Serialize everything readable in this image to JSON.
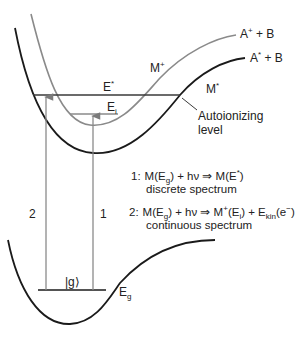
{
  "diagram": {
    "curves": {
      "ion_state": {
        "name": "M+",
        "asymptote": "A+ + B",
        "color": "#8a8a8a"
      },
      "excited_state": {
        "name": "M*",
        "asymptote": "A* + B",
        "color": "#1a1a1a"
      },
      "ground_state": {
        "name": "ground",
        "color": "#1a1a1a"
      }
    },
    "labels": {
      "ion_asymptote": {
        "main": "A",
        "sup": "+",
        "rest": " + B"
      },
      "excited_asymptote": {
        "main": "A",
        "sup": "*",
        "rest": " + B"
      },
      "ion_curve": {
        "main": "M",
        "sup": "+"
      },
      "excited_curve": {
        "main": "M",
        "sup": "*"
      },
      "e_star": {
        "main": "E",
        "sup": "*"
      },
      "e_i": {
        "main": "E",
        "sub": "i"
      },
      "autoionizing_line1": "Autoionizing",
      "autoionizing_line2": "level",
      "ground_ket": "|g⟩",
      "e_g": {
        "main": "E",
        "sub": "g"
      },
      "arrow_1": "1",
      "arrow_2": "2"
    },
    "equations": {
      "eq1": {
        "number": "1:",
        "lhs": "M(E",
        "lhs_sub": "g",
        "lhs_rest": ") + hν ⇒ M(E",
        "rhs_sup": "*",
        "rhs_end": ")",
        "caption": "discrete spectrum"
      },
      "eq2": {
        "number": "2:",
        "lhs": "M(E",
        "lhs_sub": "g",
        "lhs_rest": ") + hν ⇒ M",
        "ion_sup": "+",
        "ion_rest": "(E",
        "ion_sub": "i",
        "mid": ") + E",
        "kin_sub": "kin",
        "elec": "(e",
        "elec_sup": "−",
        "elec_end": ")",
        "caption": "continuous spectrum"
      }
    }
  }
}
